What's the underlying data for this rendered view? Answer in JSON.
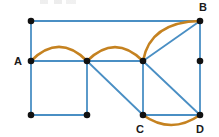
{
  "figure": {
    "background_color": "#ffffff",
    "width": 219,
    "height": 137
  },
  "style": {
    "edge_color": "#4a8fc4",
    "arc_color": "#c58220",
    "vertex_color": "#111111",
    "label_color": "#1a1a1a",
    "edge_width": 1.8,
    "arc_width": 2.6,
    "vertex_radius": 3.3
  },
  "chart_data": {
    "type": "diagram",
    "vertices": [
      {
        "id": "v1",
        "label": "",
        "x": 31,
        "y": 21
      },
      {
        "id": "A",
        "label": "A",
        "x": 31,
        "y": 61,
        "label_x": 18,
        "label_y": 65
      },
      {
        "id": "v3",
        "label": "",
        "x": 31,
        "y": 115
      },
      {
        "id": "v4",
        "label": "",
        "x": 87,
        "y": 61
      },
      {
        "id": "v5",
        "label": "",
        "x": 87,
        "y": 115
      },
      {
        "id": "v6",
        "label": "",
        "x": 143,
        "y": 61
      },
      {
        "id": "C",
        "label": "C",
        "x": 143,
        "y": 115,
        "label_x": 140,
        "label_y": 133
      },
      {
        "id": "B",
        "label": "B",
        "x": 200,
        "y": 21,
        "label_x": 203,
        "label_y": 11
      },
      {
        "id": "v9",
        "label": "",
        "x": 200,
        "y": 61
      },
      {
        "id": "D",
        "label": "D",
        "x": 200,
        "y": 115,
        "label_x": 200,
        "label_y": 133
      }
    ],
    "straight_edges": [
      {
        "from": "v1",
        "to": "B",
        "x1": 31,
        "y1": 21,
        "x2": 200,
        "y2": 21
      },
      {
        "from": "v1",
        "to": "A",
        "x1": 31,
        "y1": 21,
        "x2": 31,
        "y2": 61
      },
      {
        "from": "A",
        "to": "v4",
        "x1": 31,
        "y1": 61,
        "x2": 87,
        "y2": 61
      },
      {
        "from": "A",
        "to": "v3",
        "x1": 31,
        "y1": 61,
        "x2": 31,
        "y2": 115
      },
      {
        "from": "v3",
        "to": "v5",
        "x1": 31,
        "y1": 115,
        "x2": 87,
        "y2": 115
      },
      {
        "from": "v4",
        "to": "v5",
        "x1": 87,
        "y1": 61,
        "x2": 87,
        "y2": 115
      },
      {
        "from": "v4",
        "to": "v6",
        "x1": 87,
        "y1": 61,
        "x2": 143,
        "y2": 61
      },
      {
        "from": "v4",
        "to": "C",
        "x1": 87,
        "y1": 61,
        "x2": 143,
        "y2": 115
      },
      {
        "from": "v6",
        "to": "B",
        "x1": 143,
        "y1": 61,
        "x2": 200,
        "y2": 21
      },
      {
        "from": "v6",
        "to": "C",
        "x1": 143,
        "y1": 61,
        "x2": 143,
        "y2": 115
      },
      {
        "from": "v6",
        "to": "D",
        "x1": 143,
        "y1": 61,
        "x2": 200,
        "y2": 115
      },
      {
        "from": "B",
        "to": "v9",
        "x1": 200,
        "y1": 21,
        "x2": 200,
        "y2": 61
      },
      {
        "from": "v9",
        "to": "D",
        "x1": 200,
        "y1": 61,
        "x2": 200,
        "y2": 115
      },
      {
        "from": "C",
        "to": "D",
        "x1": 143,
        "y1": 115,
        "x2": 200,
        "y2": 115
      }
    ],
    "curved_edges": [
      {
        "from": "A",
        "to": "v4",
        "path": "M 31 61 Q 59 33 87 61",
        "bulge": "up"
      },
      {
        "from": "v4",
        "to": "v6",
        "path": "M 87 61 Q 115 33 143 61",
        "bulge": "up"
      },
      {
        "from": "v6",
        "to": "B",
        "path": "M 143 61 Q 150 22 200 21",
        "bulge": "up-left"
      },
      {
        "from": "C",
        "to": "D",
        "path": "M 143 115 Q 171 135 200 115",
        "bulge": "down"
      }
    ],
    "legend": [],
    "annotations": []
  }
}
